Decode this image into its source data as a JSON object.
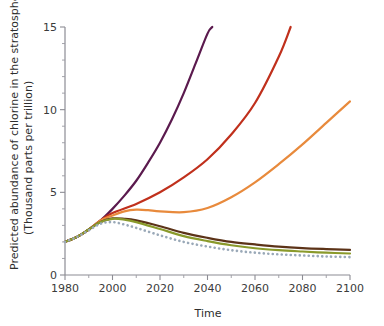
{
  "chart_data": {
    "type": "line",
    "title": "",
    "xlabel": "Time",
    "ylabel": "Predicted abundance of chlorine in the stratosphere (Thousand parts per trillion)",
    "ylabel_line1": "Predicted abundance of chlorine in the stratosphere",
    "ylabel_line2": "(Thousand parts per trillion)",
    "xlim": [
      1980,
      2100
    ],
    "ylim": [
      0,
      15
    ],
    "grid": false,
    "legend": "none",
    "x_ticks": [
      1980,
      2000,
      2020,
      2040,
      2060,
      2080,
      2100
    ],
    "x_tick_labels": [
      "1980",
      "2000",
      "2020",
      "2040",
      "2060",
      "2080",
      "2100"
    ],
    "y_ticks": [
      0,
      5,
      10,
      15
    ],
    "y_tick_labels": [
      "0",
      "5",
      "10",
      "15"
    ],
    "y_minor_tick_step": 1,
    "series": [
      {
        "name": "no-protocol",
        "color": "#5b1a4e",
        "style": "solid",
        "width": 2.2,
        "x": [
          1980,
          1985,
          1990,
          1995,
          2000,
          2005,
          2010,
          2015,
          2020,
          2025,
          2030,
          2035,
          2040,
          2042
        ],
        "values": [
          2.0,
          2.3,
          2.75,
          3.3,
          4.0,
          4.8,
          5.7,
          6.8,
          8.0,
          9.4,
          11.0,
          12.8,
          14.6,
          15.0
        ]
      },
      {
        "name": "montreal-1987",
        "color": "#c0301c",
        "style": "solid",
        "width": 2.2,
        "x": [
          1980,
          1985,
          1990,
          1995,
          2000,
          2010,
          2020,
          2030,
          2040,
          2050,
          2060,
          2070,
          2075
        ],
        "values": [
          2.0,
          2.3,
          2.75,
          3.3,
          3.75,
          4.3,
          5.0,
          5.9,
          7.0,
          8.5,
          10.4,
          13.2,
          15.0
        ]
      },
      {
        "name": "london-1990",
        "color": "#e88a3c",
        "style": "solid",
        "width": 2.2,
        "x": [
          1980,
          1985,
          1990,
          1995,
          2000,
          2005,
          2010,
          2015,
          2020,
          2030,
          2040,
          2050,
          2060,
          2070,
          2080,
          2090,
          2100
        ],
        "values": [
          2.0,
          2.3,
          2.75,
          3.3,
          3.6,
          3.85,
          3.95,
          3.92,
          3.85,
          3.8,
          4.05,
          4.7,
          5.6,
          6.7,
          7.9,
          9.2,
          10.5
        ]
      },
      {
        "name": "copenhagen-1992",
        "color": "#5c3318",
        "style": "solid",
        "width": 2.2,
        "x": [
          1980,
          1985,
          1990,
          1995,
          2000,
          2005,
          2010,
          2020,
          2030,
          2040,
          2050,
          2060,
          2070,
          2080,
          2090,
          2100
        ],
        "values": [
          2.0,
          2.3,
          2.75,
          3.2,
          3.42,
          3.4,
          3.3,
          2.95,
          2.55,
          2.25,
          2.0,
          1.85,
          1.72,
          1.63,
          1.57,
          1.52
        ]
      },
      {
        "name": "vienna-1995",
        "color": "#8a9a2b",
        "style": "solid",
        "width": 2.2,
        "x": [
          1980,
          1985,
          1990,
          1995,
          2000,
          2005,
          2010,
          2020,
          2030,
          2040,
          2050,
          2060,
          2070,
          2080,
          2090,
          2100
        ],
        "values": [
          2.0,
          2.3,
          2.75,
          3.2,
          3.4,
          3.35,
          3.2,
          2.78,
          2.35,
          2.05,
          1.8,
          1.62,
          1.5,
          1.42,
          1.35,
          1.3
        ]
      },
      {
        "name": "zero-emissions",
        "color": "#9aa9b8",
        "style": "dotted",
        "width": 2.2,
        "x": [
          1980,
          1985,
          1990,
          1995,
          2000,
          2005,
          2010,
          2020,
          2030,
          2040,
          2050,
          2060,
          2070,
          2080,
          2090,
          2100
        ],
        "values": [
          2.0,
          2.3,
          2.7,
          3.1,
          3.2,
          3.05,
          2.85,
          2.4,
          2.0,
          1.72,
          1.5,
          1.35,
          1.25,
          1.18,
          1.12,
          1.08
        ]
      }
    ]
  }
}
